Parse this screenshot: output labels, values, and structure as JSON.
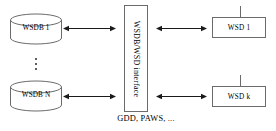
{
  "diagram": {
    "caption": "GDD, PAWS, ...",
    "databases": [
      {
        "label": "WSDB 1",
        "icon": "database-cylinder-icon"
      },
      {
        "label": "WSDB N",
        "icon": "database-cylinder-icon"
      }
    ],
    "ellipsis": "⋮",
    "interface": {
      "label": "WSDB/WSD interface",
      "orientation": "vertical"
    },
    "devices": [
      {
        "label": "WSD 1",
        "icon": "antenna-icon"
      },
      {
        "label": "WSD k",
        "icon": "antenna-icon"
      }
    ],
    "connectors": [
      {
        "name": "wsdb1-to-interface",
        "type": "double-arrow"
      },
      {
        "name": "wsdbn-to-interface",
        "type": "double-arrow"
      },
      {
        "name": "interface-to-wsd1",
        "type": "double-arrow"
      },
      {
        "name": "interface-to-wsdk",
        "type": "double-arrow"
      }
    ],
    "colors": {
      "stroke": "#6b6b6b",
      "arrow": "#1a1a1a",
      "text": "#000000",
      "background": "#ffffff"
    }
  }
}
